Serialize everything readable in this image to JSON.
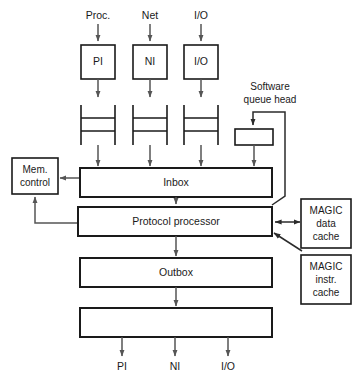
{
  "diagram": {
    "background_color": "#ffffff",
    "line_color": "#1a1a1a",
    "connector_color": "#555555",
    "top_inputs": [
      {
        "label": "Proc."
      },
      {
        "label": "Net"
      },
      {
        "label": "I/O"
      }
    ],
    "interface_boxes": [
      {
        "label": "PI"
      },
      {
        "label": "NI"
      },
      {
        "label": "I/O"
      }
    ],
    "queues": [
      {
        "name": "pi-queue"
      },
      {
        "name": "ni-queue"
      },
      {
        "name": "io-queue"
      }
    ],
    "software_queue": {
      "label_line1": "Software",
      "label_line2": "queue head",
      "box_label": ""
    },
    "mem_control": {
      "label_line1": "Mem.",
      "label_line2": "control"
    },
    "inbox": {
      "label": "Inbox"
    },
    "protocol_processor": {
      "label": "Protocol processor"
    },
    "outbox": {
      "label": "Outbox"
    },
    "output_buffer": {
      "label": ""
    },
    "magic_data_cache": {
      "label_line1": "MAGIC",
      "label_line2": "data",
      "label_line3": "cache"
    },
    "magic_instr_cache": {
      "label_line1": "MAGIC",
      "label_line2": "instr.",
      "label_line3": "cache"
    },
    "bottom_outputs": [
      {
        "label": "PI"
      },
      {
        "label": "NI"
      },
      {
        "label": "I/O"
      }
    ]
  }
}
